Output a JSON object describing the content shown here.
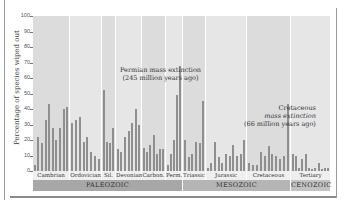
{
  "chart_data": {
    "type": "bar",
    "title": "",
    "xlabel": "",
    "ylabel": "Percentage of species wiped out",
    "ylim": [
      0,
      100
    ],
    "yticks": [
      "0",
      "10",
      "20",
      "30",
      "40",
      "50",
      "60",
      "70",
      "80",
      "90",
      "100"
    ],
    "grid": false,
    "periods": [
      {
        "name": "Cambrian",
        "x0": 0,
        "x1": 36,
        "values": [
          4,
          22,
          18,
          33,
          43,
          28,
          20,
          28,
          40,
          41
        ]
      },
      {
        "name": "Ordovician",
        "x0": 37,
        "x1": 68,
        "values": [
          31,
          33,
          35,
          19,
          22,
          12,
          10,
          8
        ]
      },
      {
        "name": "Sil.",
        "x0": 69,
        "x1": 82,
        "values": [
          52,
          19,
          18,
          28
        ]
      },
      {
        "name": "Devonian",
        "x0": 83,
        "x1": 108,
        "values": [
          14,
          12,
          22,
          26,
          31,
          40,
          30
        ]
      },
      {
        "name": "Carbon.",
        "x0": 109,
        "x1": 132,
        "values": [
          15,
          12,
          17,
          23,
          11,
          14,
          14
        ]
      },
      {
        "name": "Perm.",
        "x0": 133,
        "x1": 149,
        "values": [
          4,
          11,
          20,
          49,
          68
        ]
      },
      {
        "name": "Triassic",
        "x0": 150,
        "x1": 172,
        "values": [
          20,
          9,
          11,
          19,
          18,
          45
        ]
      },
      {
        "name": "Jurassic",
        "x0": 173,
        "x1": 213,
        "values": [
          2,
          5,
          19,
          9,
          5,
          11,
          10,
          17,
          10,
          11,
          20
        ]
      },
      {
        "name": "Cretaceous",
        "x0": 214,
        "x1": 257,
        "values": [
          5,
          4,
          4,
          12,
          10,
          16,
          11,
          10,
          8,
          10,
          43
        ]
      },
      {
        "name": "Tertiary",
        "x0": 258,
        "x1": 297,
        "values": [
          11,
          10,
          2,
          8,
          11,
          2,
          1,
          2,
          5,
          1,
          2,
          2
        ]
      }
    ],
    "eras": [
      {
        "name": "PALEOZOIC",
        "x0": 0,
        "x1": 149
      },
      {
        "name": "MESOZOIC",
        "x0": 150,
        "x1": 257
      },
      {
        "name": "CENOZOIC",
        "x0": 258,
        "x1": 297
      }
    ],
    "annotations": [
      {
        "line1": "Permian mass extinction",
        "line2": "(245 million years ago)"
      },
      {
        "line1": "Cretaceous",
        "line2": "mass extinction",
        "line3": "(66 million years ago)"
      }
    ]
  }
}
